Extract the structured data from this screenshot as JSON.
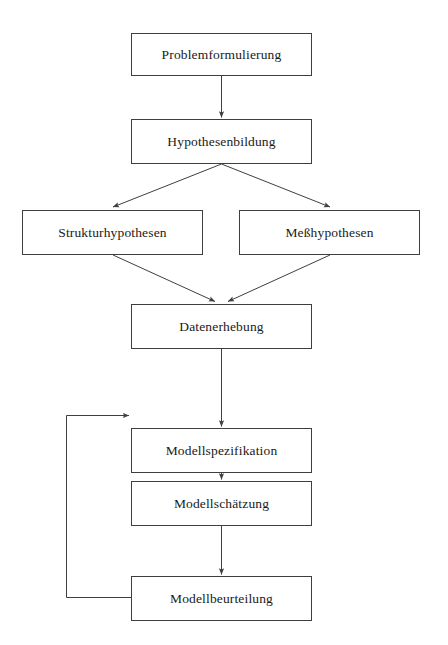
{
  "diagram": {
    "type": "flowchart",
    "orientation": "top-to-bottom",
    "background_color": "#ffffff",
    "line_color": "#3f3f3f",
    "text_color": "#1a1a1a",
    "nodes": [
      {
        "id": "problemformulierung",
        "label": "Problemformulierung",
        "x": 131,
        "y": 33,
        "width": 181,
        "height": 43
      },
      {
        "id": "hypothesenbildung",
        "label": "Hypothesenbildung",
        "x": 131,
        "y": 119,
        "width": 181,
        "height": 45
      },
      {
        "id": "strukturhypothesen",
        "label": "Strukturhypothesen",
        "x": 22,
        "y": 210,
        "width": 181,
        "height": 45
      },
      {
        "id": "messhypothesen",
        "label": "Meßhypothesen",
        "x": 239,
        "y": 210,
        "width": 181,
        "height": 45
      },
      {
        "id": "datenerhebung",
        "label": "Datenerhebung",
        "x": 131,
        "y": 304,
        "width": 181,
        "height": 45
      },
      {
        "id": "modellspezifikation",
        "label": "Modellspezifikation",
        "x": 131,
        "y": 428,
        "width": 181,
        "height": 45
      },
      {
        "id": "modellschaetzung",
        "label": "Modellschätzung",
        "x": 131,
        "y": 481,
        "width": 181,
        "height": 45
      },
      {
        "id": "modellbeurteilung",
        "label": "Modellbeurteilung",
        "x": 131,
        "y": 576,
        "width": 181,
        "height": 45
      }
    ],
    "edges": [
      {
        "id": "edge-problem-to-hypothesen",
        "from": "problemformulierung",
        "to": "hypothesenbildung",
        "kind": "straight-vertical",
        "arrow": true
      },
      {
        "id": "edge-hypothesen-to-struktur",
        "from": "hypothesenbildung",
        "to": "strukturhypothesen",
        "kind": "diagonal",
        "arrow": true
      },
      {
        "id": "edge-hypothesen-to-mess",
        "from": "hypothesenbildung",
        "to": "messhypothesen",
        "kind": "diagonal",
        "arrow": true
      },
      {
        "id": "edge-struktur-to-daten",
        "from": "strukturhypothesen",
        "to": "datenerhebung",
        "kind": "diagonal",
        "arrow": true
      },
      {
        "id": "edge-mess-to-daten",
        "from": "messhypothesen",
        "to": "datenerhebung",
        "kind": "diagonal",
        "arrow": true
      },
      {
        "id": "edge-daten-to-spezifikation",
        "from": "datenerhebung",
        "to": "modellspezifikation",
        "kind": "straight-vertical",
        "arrow": true
      },
      {
        "id": "edge-spezifikation-to-schaetzung",
        "from": "modellspezifikation",
        "to": "modellschaetzung",
        "kind": "straight-vertical",
        "arrow": true
      },
      {
        "id": "edge-schaetzung-to-beurteilung",
        "from": "modellschaetzung",
        "to": "modellbeurteilung",
        "kind": "straight-vertical",
        "arrow": true
      },
      {
        "id": "edge-beurteilung-feedback-to-spezifikation",
        "from": "modellbeurteilung",
        "to": "modellspezifikation",
        "kind": "feedback-loop-left",
        "arrow": true
      }
    ]
  }
}
